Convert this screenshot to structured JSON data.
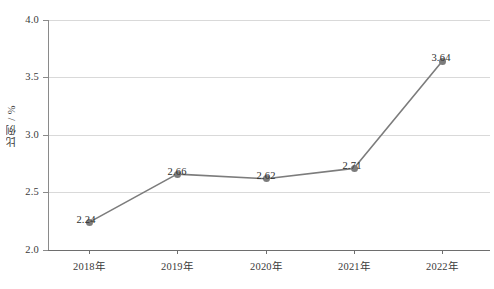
{
  "chart_data": {
    "type": "line",
    "title": "",
    "xlabel": "",
    "ylabel": "比例 / %",
    "categories": [
      "2018年",
      "2019年",
      "2020年",
      "2021年",
      "2022年"
    ],
    "values": [
      2.24,
      2.66,
      2.62,
      2.71,
      3.64
    ],
    "point_labels": [
      "2.24",
      "2.66",
      "2.62",
      "2.71",
      "3.64"
    ],
    "ylim": [
      2.0,
      4.0
    ],
    "ytick_labels": [
      "2.0",
      "2.5",
      "3.0",
      "3.5",
      "4.0"
    ],
    "ytick_values": [
      2.0,
      2.5,
      3.0,
      3.5,
      4.0
    ],
    "grid": true,
    "legend": "none",
    "series": [
      {
        "name": "比例 / %",
        "values": [
          2.24,
          2.66,
          2.62,
          2.71,
          3.64
        ],
        "line_color": "#7c7c7c",
        "marker_color": "#7c7c7c",
        "marker": "circle"
      }
    ],
    "colors": {
      "line": "#7c7c7c",
      "marker": "#7c7c7c",
      "gridline": "#d9d9d9",
      "axis": "#6e6e6e",
      "text": "#3a3a3a",
      "background": "#ffffff"
    }
  }
}
